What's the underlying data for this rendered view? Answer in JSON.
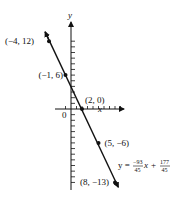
{
  "chart_data": {
    "type": "scatter",
    "title": "",
    "xlabel": "x",
    "ylabel": "y",
    "origin_label": "0",
    "xlim": [
      -4,
      9
    ],
    "ylim": [
      -14,
      12
    ],
    "grid": false,
    "points": [
      {
        "x": -4,
        "y": 12,
        "label": "(−4, 12)"
      },
      {
        "x": -1,
        "y": 6,
        "label": "(−1, 6)"
      },
      {
        "x": 2,
        "y": 0,
        "label": "(2, 0)"
      },
      {
        "x": 5,
        "y": -6,
        "label": "(5, −6)"
      },
      {
        "x": 8,
        "y": -13,
        "label": "(8, −13)"
      }
    ],
    "fit_line": {
      "slope": -2.0667,
      "intercept": 3.9333,
      "equation": {
        "lhs": "y =",
        "slope_num": "−93",
        "slope_den": "45",
        "var": "x",
        "plus": "+",
        "int_num": "177",
        "int_den": "45"
      }
    },
    "x_ticks": [
      -1,
      1,
      2,
      3,
      4,
      5,
      6,
      7,
      8,
      9
    ],
    "y_ticks": [
      -13,
      -12,
      -11,
      -10,
      -9,
      -8,
      -7,
      -6,
      -5,
      -4,
      -3,
      -2,
      -1,
      1,
      2,
      3,
      4,
      5,
      6,
      7,
      8,
      9,
      10,
      11,
      12
    ]
  }
}
